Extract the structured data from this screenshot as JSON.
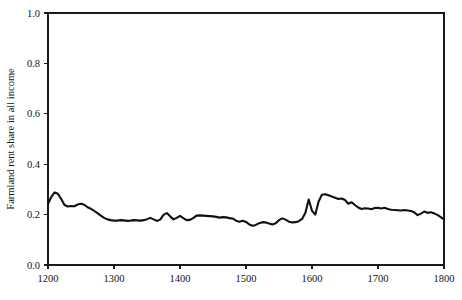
{
  "figure": {
    "width": 462,
    "height": 300,
    "background_color": "#ffffff",
    "line_color": "#111111",
    "axis_color": "#1a1a1a"
  },
  "chart_data": {
    "type": "line",
    "title": "",
    "subtitle": "",
    "xlabel": "",
    "ylabel": "Farmland rent share in all income",
    "xlim": [
      1200,
      1800
    ],
    "ylim": [
      0.0,
      1.0
    ],
    "xticks": [
      1200,
      1300,
      1400,
      1500,
      1600,
      1700,
      1800
    ],
    "xtick_labels": [
      "1200",
      "1300",
      "1400",
      "1500",
      "1600",
      "1700",
      "1800"
    ],
    "yticks": [
      0.0,
      0.2,
      0.4,
      0.6,
      0.8,
      1.0
    ],
    "ytick_labels": [
      "0.0",
      "0.2",
      "0.4",
      "0.6",
      "0.8",
      "1.0"
    ],
    "grid": false,
    "legend": false,
    "legend_position": "none",
    "series": [
      {
        "name": "Farmland rent share in all income",
        "color": "#111111",
        "x": [
          1200,
          1205,
          1210,
          1215,
          1220,
          1225,
          1230,
          1235,
          1240,
          1245,
          1250,
          1255,
          1260,
          1265,
          1270,
          1275,
          1280,
          1285,
          1290,
          1295,
          1300,
          1305,
          1310,
          1315,
          1320,
          1325,
          1330,
          1335,
          1340,
          1345,
          1350,
          1355,
          1360,
          1365,
          1370,
          1375,
          1380,
          1385,
          1390,
          1395,
          1400,
          1405,
          1410,
          1415,
          1420,
          1425,
          1430,
          1435,
          1440,
          1445,
          1450,
          1455,
          1460,
          1465,
          1470,
          1475,
          1480,
          1485,
          1490,
          1495,
          1500,
          1505,
          1510,
          1515,
          1520,
          1525,
          1530,
          1535,
          1540,
          1545,
          1550,
          1555,
          1560,
          1565,
          1570,
          1575,
          1580,
          1585,
          1590,
          1595,
          1600,
          1605,
          1610,
          1615,
          1620,
          1625,
          1630,
          1635,
          1640,
          1645,
          1650,
          1655,
          1660,
          1665,
          1670,
          1675,
          1680,
          1685,
          1690,
          1695,
          1700,
          1705,
          1710,
          1715,
          1720,
          1725,
          1730,
          1735,
          1740,
          1745,
          1750,
          1755,
          1760,
          1765,
          1770,
          1775,
          1780,
          1785,
          1790,
          1795,
          1800
        ],
        "y": [
          0.243,
          0.27,
          0.288,
          0.283,
          0.262,
          0.238,
          0.232,
          0.234,
          0.233,
          0.24,
          0.243,
          0.239,
          0.229,
          0.223,
          0.215,
          0.206,
          0.196,
          0.187,
          0.181,
          0.178,
          0.176,
          0.176,
          0.178,
          0.177,
          0.175,
          0.176,
          0.178,
          0.177,
          0.176,
          0.178,
          0.182,
          0.187,
          0.181,
          0.175,
          0.18,
          0.199,
          0.206,
          0.193,
          0.181,
          0.187,
          0.195,
          0.186,
          0.178,
          0.179,
          0.186,
          0.196,
          0.197,
          0.196,
          0.195,
          0.194,
          0.193,
          0.191,
          0.188,
          0.19,
          0.189,
          0.186,
          0.184,
          0.176,
          0.172,
          0.176,
          0.171,
          0.161,
          0.156,
          0.159,
          0.166,
          0.17,
          0.169,
          0.165,
          0.161,
          0.166,
          0.178,
          0.185,
          0.18,
          0.172,
          0.169,
          0.17,
          0.174,
          0.183,
          0.207,
          0.26,
          0.215,
          0.2,
          0.252,
          0.279,
          0.281,
          0.277,
          0.272,
          0.267,
          0.262,
          0.264,
          0.258,
          0.243,
          0.249,
          0.238,
          0.228,
          0.222,
          0.225,
          0.224,
          0.221,
          0.226,
          0.227,
          0.224,
          0.227,
          0.222,
          0.219,
          0.218,
          0.217,
          0.216,
          0.218,
          0.216,
          0.214,
          0.209,
          0.198,
          0.204,
          0.212,
          0.207,
          0.209,
          0.205,
          0.199,
          0.19,
          0.181
        ]
      }
    ]
  }
}
